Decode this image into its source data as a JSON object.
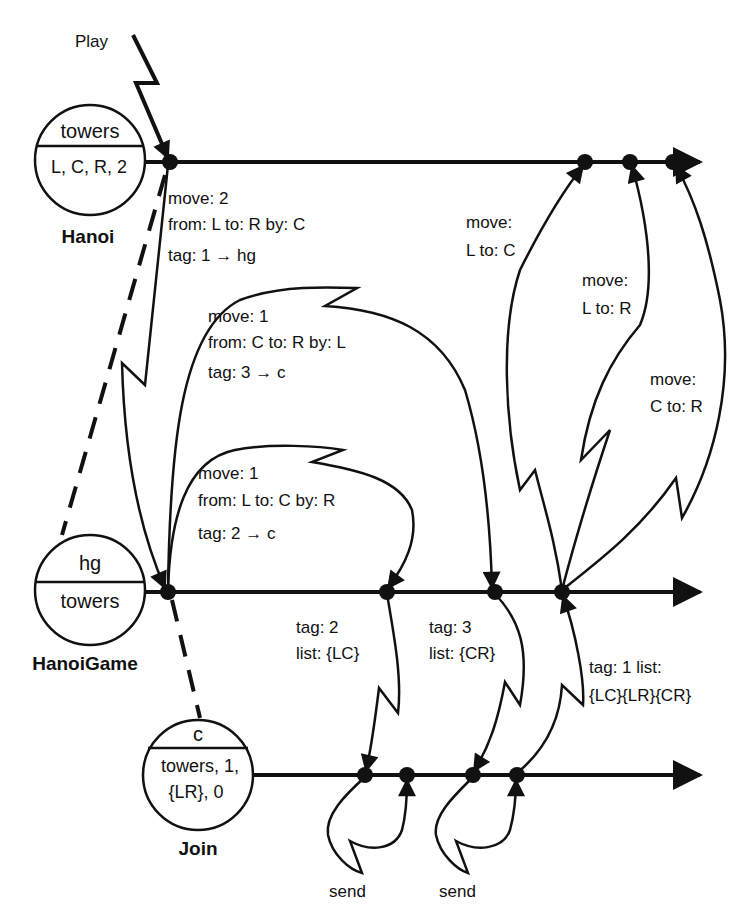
{
  "trigger": {
    "label": "Play"
  },
  "objects": [
    {
      "id": "hanoi",
      "name": "Hanoi",
      "top": "towers",
      "bottom": "L, C, R, 2"
    },
    {
      "id": "hanoigame",
      "name": "HanoiGame",
      "top": "hg",
      "bottom": "towers"
    },
    {
      "id": "join",
      "name": "Join",
      "top": "c",
      "bottom_line1": "towers, 1,",
      "bottom_line2": "{LR}, 0"
    }
  ],
  "messages": {
    "m1": {
      "line1": "move: 2",
      "line2": "from: L to: R by: C",
      "line3": "tag: 1 → hg"
    },
    "m2": {
      "line1": "move: 1",
      "line2": "from: C to: R by: L",
      "line3": "tag: 3 → c"
    },
    "m3": {
      "line1": "move: 1",
      "line2": "from: L to: C by: R",
      "line3": "tag: 2 → c"
    },
    "r1": {
      "line1": "tag: 2",
      "line2": "list: {LC}"
    },
    "r2": {
      "line1": "tag: 3",
      "line2": "list: {CR}"
    },
    "r3": {
      "line1": "tag: 1 list:",
      "line2": "{LC}{LR}{CR}"
    },
    "out1": {
      "line1": "move:",
      "line2": "L to: C"
    },
    "out2": {
      "line1": "move:",
      "line2": "L to: R"
    },
    "out3": {
      "line1": "move:",
      "line2": "C to: R"
    },
    "send1": {
      "label": "send"
    },
    "send2": {
      "label": "send"
    }
  }
}
